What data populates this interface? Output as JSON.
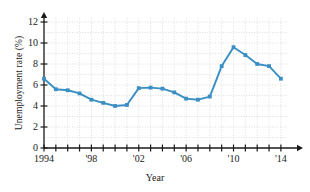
{
  "chart_data": {
    "type": "line",
    "title": "",
    "xlabel": "Year",
    "ylabel": "Unemployment rate (%)",
    "x": [
      1994,
      1995,
      1996,
      1997,
      1998,
      1999,
      2000,
      2001,
      2002,
      2003,
      2004,
      2005,
      2006,
      2007,
      2008,
      2009,
      2010,
      2011,
      2012,
      2013,
      2014
    ],
    "values": [
      6.6,
      5.6,
      5.5,
      5.2,
      4.6,
      4.3,
      4.0,
      4.1,
      5.7,
      5.75,
      5.65,
      5.3,
      4.7,
      4.6,
      4.9,
      7.8,
      9.6,
      8.85,
      8.0,
      7.8,
      6.6
    ],
    "xtick_values": [
      1994,
      1998,
      2002,
      2006,
      2010,
      2014
    ],
    "xtick_labels": [
      "1994",
      "'98",
      "'02",
      "'06",
      "'10",
      "'14"
    ],
    "ytick_values": [
      0,
      2,
      4,
      6,
      8,
      10,
      12
    ],
    "ytick_labels": [
      "0",
      "2",
      "4",
      "6",
      "8",
      "10",
      "12"
    ],
    "xlim": [
      1994,
      2014.6
    ],
    "ylim": [
      0,
      12.8
    ],
    "grid": true,
    "legend": "none",
    "series_color": "#3a8ec4",
    "grid_color": "#c8c8c8",
    "axis_color": "#1a1a1a"
  }
}
